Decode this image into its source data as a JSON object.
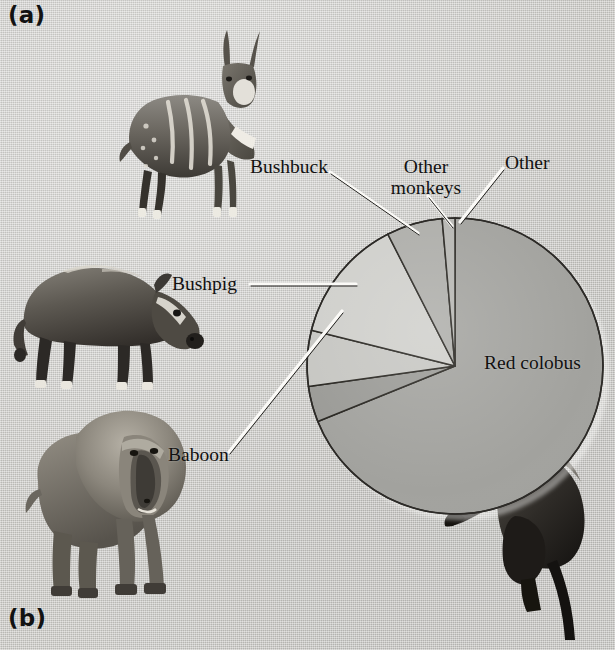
{
  "figure": {
    "panel_a_label": "(a)",
    "panel_b_label": "(b)",
    "background_color": "#c9c8c4"
  },
  "chart_data": {
    "type": "pie",
    "title": "",
    "subtitle": "",
    "xlabel": "",
    "ylabel": "",
    "legend_position": "callout-labels",
    "grid": false,
    "units": "percent of prey items",
    "start_angle_deg": 0,
    "direction": "clockwise",
    "categories": [
      "Red colobus",
      "Baboon",
      "Bushpig",
      "Other monkeys",
      "Bushbuck",
      "Other"
    ],
    "values": [
      69,
      4,
      6,
      14,
      6,
      1.5
    ],
    "slices": [
      {
        "label": "Red colobus",
        "value": 69,
        "color": "#a2a29e",
        "start_deg": 0,
        "end_deg": 248,
        "label_placement": "inside-right"
      },
      {
        "label": "Baboon",
        "value": 4,
        "color": "#9a9a96",
        "start_deg": 248,
        "end_deg": 262,
        "label_placement": "callout-left"
      },
      {
        "label": "Bushpig",
        "value": 6,
        "color": "#c6c6c2",
        "start_deg": 262,
        "end_deg": 284,
        "label_placement": "callout-left"
      },
      {
        "label": "Other monkeys",
        "value": 14,
        "color": "#cfcfcb",
        "start_deg": 284,
        "end_deg": 333,
        "label_placement": "callout-top"
      },
      {
        "label": "Bushbuck",
        "value": 6,
        "color": "#adada9",
        "start_deg": 333,
        "end_deg": 355,
        "label_placement": "callout-top-left"
      },
      {
        "label": "Other",
        "value": 1.5,
        "color": "#b6b6b2",
        "start_deg": 355,
        "end_deg": 360,
        "label_placement": "callout-top-right"
      }
    ]
  },
  "labels": {
    "bushbuck": "Bushbuck",
    "other_monkeys_line1": "Other",
    "other_monkeys_line2": "monkeys",
    "other": "Other",
    "bushpig": "Bushpig",
    "baboon": "Baboon",
    "red_colobus": "Red colobus"
  },
  "photos": [
    {
      "name": "bushbuck-photo",
      "subject": "Bushbuck antelope, standing, striped flank"
    },
    {
      "name": "bushpig-photo",
      "subject": "Bushpig, standing in profile facing right"
    },
    {
      "name": "baboon-photo",
      "subject": "Baboon, standing quadrupedal facing viewer"
    },
    {
      "name": "colobus-photo",
      "subject": "Red colobus monkey, seated with long tail"
    }
  ]
}
